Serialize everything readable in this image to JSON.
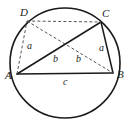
{
  "figure": {
    "type": "geometry-diagram",
    "colors": {
      "stroke": "#1a1a1a",
      "dashed_stroke": "#555555",
      "background": "#ffffff",
      "label": "#1a1a1a"
    },
    "circle": {
      "center_x": 65,
      "center_y": 63,
      "radius": 55
    },
    "vertices": [
      {
        "name": "D",
        "label": "D",
        "x": 27,
        "y": 21,
        "label_x": 20,
        "label_y": 7
      },
      {
        "name": "C",
        "label": "C",
        "x": 101,
        "y": 22,
        "label_x": 102,
        "label_y": 8
      },
      {
        "name": "A",
        "label": "A",
        "x": 17,
        "y": 74,
        "label_x": 5,
        "label_y": 70
      },
      {
        "name": "B",
        "label": "B",
        "x": 113,
        "y": 73,
        "label_x": 117,
        "label_y": 69
      }
    ],
    "segments": [
      {
        "name": "side-AB",
        "from": "A",
        "to": "B",
        "style": "solid",
        "x1": 17,
        "y1": 74,
        "x2": 113,
        "y2": 73
      },
      {
        "name": "side-BC",
        "from": "B",
        "to": "C",
        "style": "solid",
        "x1": 113,
        "y1": 73,
        "x2": 101,
        "y2": 22
      },
      {
        "name": "side-AD",
        "from": "A",
        "to": "D",
        "style": "dashed",
        "x1": 17,
        "y1": 74,
        "x2": 27,
        "y2": 21
      },
      {
        "name": "side-DC",
        "from": "D",
        "to": "C",
        "style": "dashed",
        "x1": 27,
        "y1": 21,
        "x2": 101,
        "y2": 22
      },
      {
        "name": "diagonal-AC",
        "from": "A",
        "to": "C",
        "style": "solid",
        "x1": 17,
        "y1": 74,
        "x2": 101,
        "y2": 22
      },
      {
        "name": "diagonal-DB",
        "from": "D",
        "to": "B",
        "style": "dashed",
        "x1": 27,
        "y1": 21,
        "x2": 113,
        "y2": 73
      }
    ],
    "side_labels": [
      {
        "name": "label-a-left",
        "text": "a",
        "segment": "side-AD",
        "x": 27,
        "y": 41
      },
      {
        "name": "label-a-right",
        "text": "a",
        "segment": "side-BC",
        "x": 99,
        "y": 43
      },
      {
        "name": "label-b-left",
        "text": "b",
        "segment": "diagonal-AC",
        "x": 53,
        "y": 54
      },
      {
        "name": "label-b-right",
        "text": "b",
        "segment": "diagonal-DB",
        "x": 76,
        "y": 54
      },
      {
        "name": "label-c-bottom",
        "text": "c",
        "segment": "side-AB",
        "x": 63,
        "y": 77
      }
    ]
  }
}
